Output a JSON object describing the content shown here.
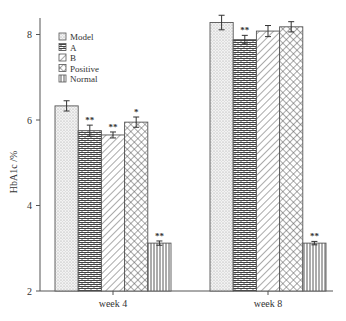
{
  "chart_data": {
    "type": "bar",
    "title": "",
    "xlabel": "",
    "ylabel": "HbA1c /%",
    "ylim": [
      2,
      8.6
    ],
    "yticks": [
      2,
      4,
      6,
      8
    ],
    "grid": false,
    "legend_position": "upper-left",
    "categories": [
      "week 4",
      "week 8"
    ],
    "series": [
      {
        "name": "Model",
        "pattern": "dots",
        "values": [
          6.33,
          8.28
        ],
        "errors": [
          0.12,
          0.17
        ],
        "significance": [
          "",
          ""
        ]
      },
      {
        "name": "A",
        "pattern": "bricks",
        "values": [
          5.75,
          7.88
        ],
        "errors": [
          0.13,
          0.1
        ],
        "significance": [
          "**",
          "**"
        ]
      },
      {
        "name": "B",
        "pattern": "diagonal",
        "values": [
          5.65,
          8.08
        ],
        "errors": [
          0.07,
          0.13
        ],
        "significance": [
          "**",
          ""
        ]
      },
      {
        "name": "Positive",
        "pattern": "crosshatch",
        "values": [
          5.95,
          8.18
        ],
        "errors": [
          0.12,
          0.12
        ],
        "significance": [
          "*",
          ""
        ]
      },
      {
        "name": "Normal",
        "pattern": "vertical",
        "values": [
          3.12,
          3.12
        ],
        "errors": [
          0.05,
          0.04
        ],
        "significance": [
          "**",
          "**"
        ]
      }
    ]
  },
  "colors": {
    "axis": "#555555",
    "pattern_stroke": "#444444",
    "bar_edge": "#555555",
    "background": "#ffffff"
  }
}
